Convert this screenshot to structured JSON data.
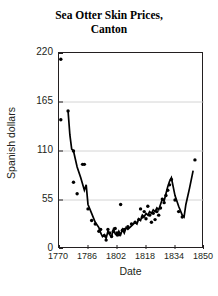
{
  "chart_data": {
    "type": "scatter",
    "title": "Sea Otter Skin Prices, Canton",
    "title_line1": "Sea Otter Skin Prices,",
    "title_line2": "Canton",
    "xlabel": "Date",
    "ylabel": "Spanish dollars",
    "xlim": [
      1770,
      1850
    ],
    "ylim": [
      0,
      220
    ],
    "xticks": [
      1770,
      1786,
      1802,
      1818,
      1834,
      1850
    ],
    "yticks": [
      0,
      55,
      110,
      165,
      220
    ],
    "grid": "horizontal",
    "legend": "none",
    "series": [
      {
        "name": "Observed prices",
        "marker": "dot",
        "points": [
          {
            "x": 1771,
            "y": 213
          },
          {
            "x": 1771,
            "y": 145
          },
          {
            "x": 1775,
            "y": 155
          },
          {
            "x": 1778,
            "y": 110
          },
          {
            "x": 1778,
            "y": 75
          },
          {
            "x": 1783,
            "y": 95
          },
          {
            "x": 1784,
            "y": 95
          },
          {
            "x": 1780,
            "y": 62
          },
          {
            "x": 1786,
            "y": 45
          },
          {
            "x": 1788,
            "y": 32
          },
          {
            "x": 1790,
            "y": 28
          },
          {
            "x": 1792,
            "y": 20
          },
          {
            "x": 1793,
            "y": 22
          },
          {
            "x": 1795,
            "y": 15
          },
          {
            "x": 1796,
            "y": 10
          },
          {
            "x": 1797,
            "y": 22
          },
          {
            "x": 1798,
            "y": 18
          },
          {
            "x": 1799,
            "y": 14
          },
          {
            "x": 1800,
            "y": 20
          },
          {
            "x": 1801,
            "y": 23
          },
          {
            "x": 1802,
            "y": 18
          },
          {
            "x": 1803,
            "y": 16
          },
          {
            "x": 1804,
            "y": 50
          },
          {
            "x": 1805,
            "y": 21
          },
          {
            "x": 1806,
            "y": 22
          },
          {
            "x": 1808,
            "y": 25
          },
          {
            "x": 1810,
            "y": 28
          },
          {
            "x": 1812,
            "y": 30
          },
          {
            "x": 1814,
            "y": 33
          },
          {
            "x": 1815,
            "y": 45
          },
          {
            "x": 1816,
            "y": 36
          },
          {
            "x": 1817,
            "y": 42
          },
          {
            "x": 1818,
            "y": 34
          },
          {
            "x": 1819,
            "y": 48
          },
          {
            "x": 1820,
            "y": 38
          },
          {
            "x": 1821,
            "y": 30
          },
          {
            "x": 1822,
            "y": 40
          },
          {
            "x": 1823,
            "y": 33
          },
          {
            "x": 1824,
            "y": 42
          },
          {
            "x": 1825,
            "y": 38
          },
          {
            "x": 1826,
            "y": 46
          },
          {
            "x": 1827,
            "y": 56
          },
          {
            "x": 1828,
            "y": 52
          },
          {
            "x": 1829,
            "y": 60
          },
          {
            "x": 1830,
            "y": 66
          },
          {
            "x": 1831,
            "y": 72
          },
          {
            "x": 1832,
            "y": 78
          },
          {
            "x": 1834,
            "y": 55
          },
          {
            "x": 1836,
            "y": 42
          },
          {
            "x": 1838,
            "y": 36
          },
          {
            "x": 1845,
            "y": 100
          }
        ]
      },
      {
        "name": "Price trend",
        "marker": "line",
        "points": [
          {
            "x": 1775,
            "y": 155
          },
          {
            "x": 1776,
            "y": 128
          },
          {
            "x": 1777,
            "y": 112
          },
          {
            "x": 1778,
            "y": 110
          },
          {
            "x": 1780,
            "y": 92
          },
          {
            "x": 1782,
            "y": 80
          },
          {
            "x": 1784,
            "y": 66
          },
          {
            "x": 1785,
            "y": 72
          },
          {
            "x": 1786,
            "y": 50
          },
          {
            "x": 1788,
            "y": 40
          },
          {
            "x": 1790,
            "y": 30
          },
          {
            "x": 1792,
            "y": 24
          },
          {
            "x": 1793,
            "y": 18
          },
          {
            "x": 1794,
            "y": 14
          },
          {
            "x": 1795,
            "y": 16
          },
          {
            "x": 1796,
            "y": 12
          },
          {
            "x": 1797,
            "y": 20
          },
          {
            "x": 1798,
            "y": 16
          },
          {
            "x": 1799,
            "y": 14
          },
          {
            "x": 1800,
            "y": 22
          },
          {
            "x": 1801,
            "y": 17
          },
          {
            "x": 1802,
            "y": 15
          },
          {
            "x": 1803,
            "y": 20
          },
          {
            "x": 1804,
            "y": 16
          },
          {
            "x": 1805,
            "y": 22
          },
          {
            "x": 1806,
            "y": 18
          },
          {
            "x": 1807,
            "y": 24
          },
          {
            "x": 1808,
            "y": 22
          },
          {
            "x": 1810,
            "y": 26
          },
          {
            "x": 1812,
            "y": 30
          },
          {
            "x": 1813,
            "y": 28
          },
          {
            "x": 1814,
            "y": 34
          },
          {
            "x": 1815,
            "y": 32
          },
          {
            "x": 1816,
            "y": 38
          },
          {
            "x": 1817,
            "y": 36
          },
          {
            "x": 1818,
            "y": 40
          },
          {
            "x": 1819,
            "y": 38
          },
          {
            "x": 1820,
            "y": 42
          },
          {
            "x": 1821,
            "y": 40
          },
          {
            "x": 1822,
            "y": 44
          },
          {
            "x": 1823,
            "y": 42
          },
          {
            "x": 1824,
            "y": 46
          },
          {
            "x": 1825,
            "y": 44
          },
          {
            "x": 1826,
            "y": 50
          },
          {
            "x": 1827,
            "y": 56
          },
          {
            "x": 1828,
            "y": 54
          },
          {
            "x": 1829,
            "y": 62
          },
          {
            "x": 1830,
            "y": 70
          },
          {
            "x": 1831,
            "y": 76
          },
          {
            "x": 1832,
            "y": 80
          },
          {
            "x": 1834,
            "y": 60
          },
          {
            "x": 1836,
            "y": 48
          },
          {
            "x": 1838,
            "y": 38
          },
          {
            "x": 1839,
            "y": 36
          },
          {
            "x": 1840,
            "y": 50
          },
          {
            "x": 1842,
            "y": 68
          },
          {
            "x": 1844,
            "y": 88
          }
        ]
      }
    ]
  }
}
